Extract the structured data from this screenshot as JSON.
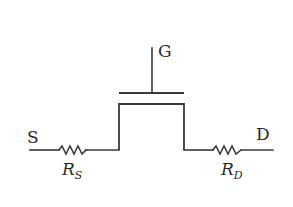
{
  "diagram": {
    "terminals": {
      "gate": "G",
      "source": "S",
      "drain": "D"
    },
    "resistors": {
      "source": {
        "symbol": "R",
        "subscript": "S"
      },
      "drain": {
        "symbol": "R",
        "subscript": "D"
      }
    },
    "colors": {
      "line": "#3a3a3a",
      "text": "#2a2a2a",
      "background": "#ffffff"
    }
  }
}
